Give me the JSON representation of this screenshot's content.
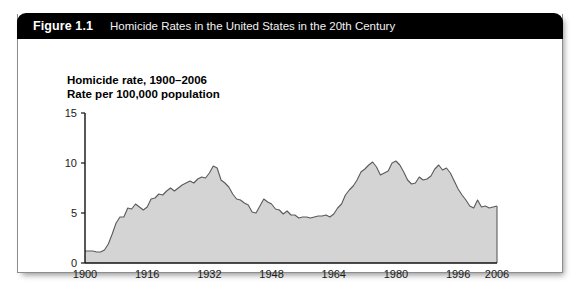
{
  "figure": {
    "number": "Figure 1.1",
    "caption": "Homicide Rates in the United States in the 20th Century"
  },
  "chart_data": {
    "type": "area",
    "title": "Homicide rate, 1900–2006",
    "subtitle": "Rate per 100,000 population",
    "xlabel": "",
    "ylabel": "",
    "grid": false,
    "legend": "none",
    "xlim": [
      1900,
      2006
    ],
    "ylim": [
      0,
      15
    ],
    "xticks": [
      1900,
      1916,
      1932,
      1948,
      1964,
      1980,
      1996,
      2006
    ],
    "xtick_labels": [
      "1900",
      "1916",
      "1932",
      "1948",
      "1964",
      "1980",
      "1996",
      "2006"
    ],
    "yticks": [
      0,
      5,
      10,
      15
    ],
    "ytick_labels": [
      "0",
      "5",
      "10",
      "15"
    ],
    "series_name": "Homicide rate per 100,000 population",
    "fill_color": "#d4d4d4",
    "line_color": "#5a5a5a",
    "x": [
      1900,
      1901,
      1902,
      1903,
      1904,
      1905,
      1906,
      1907,
      1908,
      1909,
      1910,
      1911,
      1912,
      1913,
      1914,
      1915,
      1916,
      1917,
      1918,
      1919,
      1920,
      1921,
      1922,
      1923,
      1924,
      1925,
      1926,
      1927,
      1928,
      1929,
      1930,
      1931,
      1932,
      1933,
      1934,
      1935,
      1936,
      1937,
      1938,
      1939,
      1940,
      1941,
      1942,
      1943,
      1944,
      1945,
      1946,
      1947,
      1948,
      1949,
      1950,
      1951,
      1952,
      1953,
      1954,
      1955,
      1956,
      1957,
      1958,
      1959,
      1960,
      1961,
      1962,
      1963,
      1964,
      1965,
      1966,
      1967,
      1968,
      1969,
      1970,
      1971,
      1972,
      1973,
      1974,
      1975,
      1976,
      1977,
      1978,
      1979,
      1980,
      1981,
      1982,
      1983,
      1984,
      1985,
      1986,
      1987,
      1988,
      1989,
      1990,
      1991,
      1992,
      1993,
      1994,
      1995,
      1996,
      1997,
      1998,
      1999,
      2000,
      2001,
      2002,
      2003,
      2004,
      2005,
      2006
    ],
    "values": [
      1.2,
      1.2,
      1.2,
      1.1,
      1.1,
      1.3,
      1.9,
      2.9,
      4.0,
      4.6,
      4.6,
      5.5,
      5.4,
      5.9,
      5.6,
      5.3,
      5.6,
      6.4,
      6.5,
      6.9,
      6.8,
      7.2,
      7.5,
      7.2,
      7.5,
      7.8,
      8.0,
      8.2,
      8.0,
      8.4,
      8.6,
      8.5,
      9.0,
      9.7,
      9.5,
      8.3,
      8.0,
      7.6,
      6.9,
      6.4,
      6.3,
      6.0,
      5.8,
      5.1,
      5.0,
      5.7,
      6.4,
      6.1,
      5.9,
      5.4,
      5.3,
      4.9,
      5.2,
      4.8,
      4.8,
      4.5,
      4.6,
      4.6,
      4.5,
      4.6,
      4.7,
      4.7,
      4.8,
      4.6,
      4.9,
      5.5,
      5.9,
      6.8,
      7.3,
      7.7,
      8.3,
      9.1,
      9.4,
      9.8,
      10.1,
      9.6,
      8.8,
      9.0,
      9.2,
      10.0,
      10.2,
      9.8,
      9.1,
      8.3,
      7.9,
      8.0,
      8.6,
      8.3,
      8.4,
      8.7,
      9.4,
      9.8,
      9.3,
      9.5,
      9.0,
      8.2,
      7.4,
      6.8,
      6.3,
      5.7,
      5.5,
      6.3,
      5.6,
      5.7,
      5.5,
      5.6,
      5.7
    ]
  }
}
